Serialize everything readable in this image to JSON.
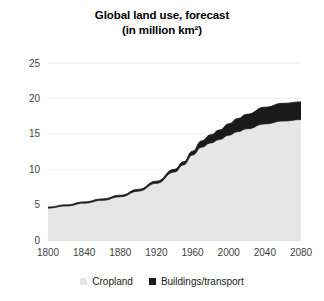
{
  "title": {
    "line1": "Global land use, forecast",
    "line2": "(in million km²)"
  },
  "legend": {
    "position": "bottom",
    "items": [
      {
        "label": "Cropland",
        "color": "#E6E6E6",
        "swatch_name": "legend-swatch-cropland"
      },
      {
        "label": "Buildings/transport",
        "color": "#1A1A1A",
        "swatch_name": "legend-swatch-buildings"
      }
    ]
  },
  "axes": {
    "y_ticks": [
      "0",
      "5",
      "10",
      "15",
      "20",
      "25"
    ],
    "x_ticks": [
      "1800",
      "1840",
      "1880",
      "1920",
      "1960",
      "2000",
      "2040",
      "2080"
    ],
    "ylim": [
      0,
      25
    ],
    "xlim": [
      1800,
      2080
    ],
    "grid": "horizontal"
  },
  "chart_data": {
    "type": "area",
    "stacked": true,
    "title": "Global land use, forecast (in million km²)",
    "xlabel": "",
    "ylabel": "",
    "unit": "million km²",
    "xlim": [
      1800,
      2080
    ],
    "ylim": [
      0,
      25
    ],
    "ytick_values": [
      0,
      5,
      10,
      15,
      20,
      25
    ],
    "xtick_values": [
      1800,
      1840,
      1880,
      1920,
      1960,
      2000,
      2040,
      2080
    ],
    "grid": true,
    "legend_position": "bottom",
    "x": [
      1800,
      1820,
      1840,
      1860,
      1880,
      1900,
      1920,
      1940,
      1950,
      1960,
      1970,
      1980,
      1990,
      2000,
      2010,
      2020,
      2040,
      2060,
      2080
    ],
    "series": [
      {
        "name": "Cropland",
        "color": "#E6E6E6",
        "values": [
          4.5,
          4.8,
          5.2,
          5.6,
          6.1,
          6.9,
          8.0,
          9.6,
          10.6,
          12.0,
          13.1,
          13.7,
          14.2,
          14.8,
          15.3,
          15.7,
          16.4,
          16.8,
          17.0
        ]
      },
      {
        "name": "Buildings/transport",
        "color": "#1A1A1A",
        "values": [
          0.15,
          0.15,
          0.18,
          0.2,
          0.22,
          0.25,
          0.3,
          0.38,
          0.45,
          0.55,
          0.9,
          1.15,
          1.35,
          1.6,
          1.85,
          2.05,
          2.35,
          2.5,
          2.5
        ]
      }
    ],
    "totals": [
      4.65,
      4.95,
      5.38,
      5.8,
      6.32,
      7.15,
      8.3,
      9.98,
      11.05,
      12.55,
      14.0,
      14.85,
      15.55,
      16.4,
      17.15,
      17.75,
      18.75,
      19.3,
      19.5
    ]
  }
}
